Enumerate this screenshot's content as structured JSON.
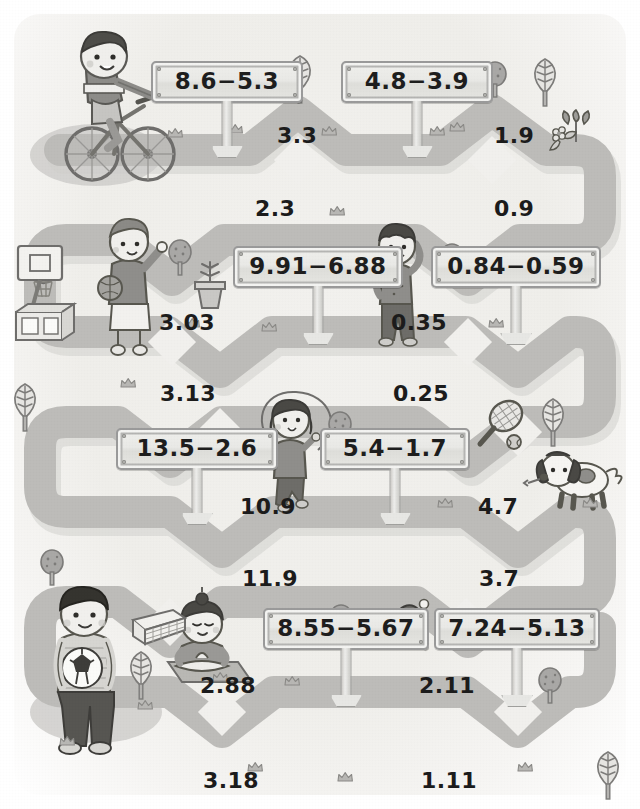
{
  "page": {
    "kind": "decimal-subtraction-worksheet-maze",
    "background_color": "#efeeea",
    "path_color": "#b9b9b7",
    "path_shadow_color": "#cccbc8",
    "ink_color": "#1c1c1c"
  },
  "signs": [
    {
      "id": "sign-1",
      "text": "8.6−5.3",
      "x": 151,
      "y": 61,
      "w": 124,
      "post": 46
    },
    {
      "id": "sign-2",
      "text": "4.8−3.9",
      "x": 341,
      "y": 61,
      "w": 124,
      "post": 46
    },
    {
      "id": "sign-3",
      "text": "9.91−6.88",
      "x": 233,
      "y": 246,
      "w": 142,
      "post": 48
    },
    {
      "id": "sign-4",
      "text": "0.84−0.59",
      "x": 431,
      "y": 246,
      "w": 142,
      "post": 48
    },
    {
      "id": "sign-5",
      "text": "13.5−2.6",
      "x": 116,
      "y": 428,
      "w": 134,
      "post": 46
    },
    {
      "id": "sign-6",
      "text": "5.4−1.7",
      "x": 320,
      "y": 428,
      "w": 122,
      "post": 46
    },
    {
      "id": "sign-7",
      "text": "8.55−5.67",
      "x": 263,
      "y": 608,
      "w": 138,
      "post": 48
    },
    {
      "id": "sign-8",
      "text": "7.24−5.13",
      "x": 434,
      "y": 608,
      "w": 138,
      "post": 48
    }
  ],
  "answers": [
    {
      "id": "answer-3-3",
      "value": "3.3",
      "x": 277,
      "y": 123
    },
    {
      "id": "answer-1-9",
      "value": "1.9",
      "x": 494,
      "y": 123
    },
    {
      "id": "answer-2-3",
      "value": "2.3",
      "x": 255,
      "y": 196
    },
    {
      "id": "answer-0-9",
      "value": "0.9",
      "x": 494,
      "y": 196
    },
    {
      "id": "answer-3-03",
      "value": "3.03",
      "x": 159,
      "y": 310
    },
    {
      "id": "answer-0-35",
      "value": "0.35",
      "x": 391,
      "y": 310
    },
    {
      "id": "answer-3-13",
      "value": "3.13",
      "x": 160,
      "y": 381
    },
    {
      "id": "answer-0-25",
      "value": "0.25",
      "x": 393,
      "y": 381
    },
    {
      "id": "answer-10-9",
      "value": "10.9",
      "x": 240,
      "y": 494
    },
    {
      "id": "answer-4-7",
      "value": "4.7",
      "x": 478,
      "y": 494
    },
    {
      "id": "answer-11-9",
      "value": "11.9",
      "x": 242,
      "y": 566
    },
    {
      "id": "answer-3-7",
      "value": "3.7",
      "x": 479,
      "y": 566
    },
    {
      "id": "answer-2-88",
      "value": "2.88",
      "x": 200,
      "y": 673
    },
    {
      "id": "answer-2-11",
      "value": "2.11",
      "x": 419,
      "y": 673
    },
    {
      "id": "answer-3-18",
      "value": "3.18",
      "x": 203,
      "y": 768
    },
    {
      "id": "answer-1-11",
      "value": "1.11",
      "x": 421,
      "y": 768
    }
  ],
  "characters": [
    {
      "id": "boy-on-bicycle",
      "label": "boy riding a bicycle",
      "x": 48,
      "y": 30
    },
    {
      "id": "boy-with-basketball",
      "label": "boy holding a basketball",
      "x": 96,
      "y": 218
    },
    {
      "id": "basketball-hoop",
      "label": "basketball hoop and box",
      "x": 14,
      "y": 240
    },
    {
      "id": "boy-stretching",
      "label": "boy stretching",
      "x": 368,
      "y": 222
    },
    {
      "id": "girl-jumping-rope",
      "label": "girl skipping rope",
      "x": 264,
      "y": 396
    },
    {
      "id": "dog",
      "label": "puppy with a bone",
      "x": 540,
      "y": 448
    },
    {
      "id": "boy-with-soccer",
      "label": "boy holding a soccer ball",
      "x": 48,
      "y": 584
    },
    {
      "id": "girl-meditating",
      "label": "girl meditating on a mat",
      "x": 172,
      "y": 596
    }
  ],
  "props": [
    {
      "id": "leaf-tree-1",
      "label": "leaf tree",
      "x": 292,
      "y": 52
    },
    {
      "id": "leaf-tree-2",
      "label": "leaf tree",
      "x": 535,
      "y": 55
    },
    {
      "id": "round-tree-1",
      "label": "round tree",
      "x": 489,
      "y": 62
    },
    {
      "id": "flower-tulip",
      "label": "tulip and flower",
      "x": 552,
      "y": 117
    },
    {
      "id": "round-tree-2",
      "label": "round tree",
      "x": 172,
      "y": 239
    },
    {
      "id": "potted-plant",
      "label": "potted plant",
      "x": 199,
      "y": 252
    },
    {
      "id": "round-tree-3",
      "label": "round tree",
      "x": 444,
      "y": 243
    },
    {
      "id": "leaf-tree-3",
      "label": "leaf tree",
      "x": 12,
      "y": 378
    },
    {
      "id": "round-tree-4",
      "label": "round tree",
      "x": 331,
      "y": 412
    },
    {
      "id": "tennis-racket",
      "label": "tennis racket and ball",
      "x": 478,
      "y": 398
    },
    {
      "id": "leaf-tree-4",
      "label": "leaf tree",
      "x": 540,
      "y": 392
    },
    {
      "id": "round-tree-5",
      "label": "round tree",
      "x": 42,
      "y": 550
    },
    {
      "id": "soccer-goal",
      "label": "soccer goal net",
      "x": 131,
      "y": 608
    },
    {
      "id": "leaf-tree-5",
      "label": "leaf tree",
      "x": 131,
      "y": 648
    },
    {
      "id": "round-tree-6",
      "label": "round tree",
      "x": 332,
      "y": 605
    },
    {
      "id": "ping-pong",
      "label": "ping pong paddle and ball",
      "x": 392,
      "y": 602
    },
    {
      "id": "round-tree-7",
      "label": "round tree",
      "x": 540,
      "y": 668
    },
    {
      "id": "leaf-tree-6",
      "label": "leaf tree",
      "x": 598,
      "y": 748
    }
  ],
  "crowns": [
    {
      "x": 168,
      "y": 128
    },
    {
      "x": 228,
      "y": 124
    },
    {
      "x": 322,
      "y": 126
    },
    {
      "x": 430,
      "y": 126
    },
    {
      "x": 450,
      "y": 122
    },
    {
      "x": 330,
      "y": 206
    },
    {
      "x": 185,
      "y": 318
    },
    {
      "x": 262,
      "y": 322
    },
    {
      "x": 489,
      "y": 318
    },
    {
      "x": 121,
      "y": 378
    },
    {
      "x": 438,
      "y": 498
    },
    {
      "x": 583,
      "y": 498
    },
    {
      "x": 213,
      "y": 672
    },
    {
      "x": 285,
      "y": 676
    },
    {
      "x": 138,
      "y": 700
    },
    {
      "x": 248,
      "y": 762
    },
    {
      "x": 338,
      "y": 772
    },
    {
      "x": 518,
      "y": 762
    },
    {
      "x": 60,
      "y": 736
    }
  ]
}
